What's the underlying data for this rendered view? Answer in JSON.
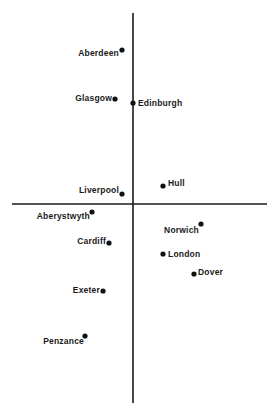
{
  "chart_data": {
    "type": "scatter",
    "title": "",
    "xlabel": "",
    "ylabel": "",
    "grid": false,
    "legend": null,
    "origin_px": [
      133,
      204
    ],
    "axes_px": {
      "horizontal": {
        "x1": 12,
        "x2": 267,
        "y": 204
      },
      "vertical": {
        "x": 133,
        "y1": 13,
        "y2": 403
      }
    },
    "xlim": [
      -121,
      134
    ],
    "ylim": [
      -199,
      191
    ],
    "points": [
      {
        "name": "Aberdeen",
        "x": -11,
        "y": 154,
        "label_anchor": "end",
        "lx": -3,
        "ly": 3
      },
      {
        "name": "Glasgow",
        "x": -18,
        "y": 105,
        "label_anchor": "end",
        "lx": -3,
        "ly": -1
      },
      {
        "name": "Edinburgh",
        "x": 0,
        "y": 101,
        "label_anchor": "start",
        "lx": 5,
        "ly": 0
      },
      {
        "name": "Hull",
        "x": 30,
        "y": 18,
        "label_anchor": "start",
        "lx": 5,
        "ly": -3
      },
      {
        "name": "Liverpool",
        "x": -11,
        "y": 10,
        "label_anchor": "end",
        "lx": -3,
        "ly": -4
      },
      {
        "name": "Aberystwyth",
        "x": -41,
        "y": -8,
        "label_anchor": "end",
        "lx": -2,
        "ly": 4
      },
      {
        "name": "Norwich",
        "x": 68,
        "y": -20,
        "label_anchor": "end",
        "lx": -2,
        "ly": 6
      },
      {
        "name": "Cardiff",
        "x": -24,
        "y": -39,
        "label_anchor": "end",
        "lx": -3,
        "ly": -2
      },
      {
        "name": "London",
        "x": 30,
        "y": -50,
        "label_anchor": "start",
        "lx": 5,
        "ly": 0
      },
      {
        "name": "Dover",
        "x": 61,
        "y": -70,
        "label_anchor": "start",
        "lx": 4,
        "ly": -2
      },
      {
        "name": "Exeter",
        "x": -30,
        "y": -87,
        "label_anchor": "end",
        "lx": -3,
        "ly": -1
      },
      {
        "name": "Penzance",
        "x": -48,
        "y": -132,
        "label_anchor": "end",
        "lx": -1,
        "ly": 5
      }
    ]
  }
}
